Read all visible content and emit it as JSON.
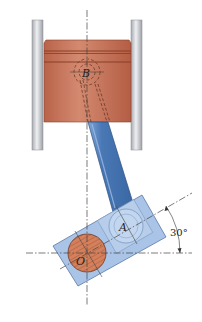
{
  "figure": {
    "labels": {
      "piston_pin": "B",
      "crank_pin": "A",
      "crank_center": "O",
      "angle": "30°"
    },
    "angle_deg": 30,
    "colors": {
      "piston": "#c8735a",
      "piston_dark": "#9a4a34",
      "cylinder_wall": "#c9cbcf",
      "rod": "#4f7fbf",
      "rod_dark": "#2f5f9f",
      "crank_block": "#a9c4e6",
      "crank_pin_ring": "#bcd2ee",
      "shaft": "#d98a66",
      "line": "#444444",
      "background": "#ffffff"
    },
    "geometry": {
      "vertical_centerline_x": 87,
      "horizontal_centerline_y": 253,
      "B_center": [
        87,
        72
      ],
      "A_center": [
        126,
        226
      ],
      "O_center": [
        87,
        253
      ]
    }
  }
}
